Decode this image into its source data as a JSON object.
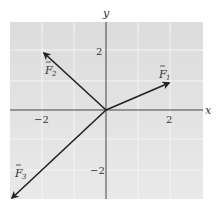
{
  "diagram": {
    "type": "vector-diagram",
    "axes": {
      "x_label": "x",
      "y_label": "y",
      "x_ticks": [
        {
          "value": -2,
          "label": "−2"
        },
        {
          "value": 2,
          "label": "2"
        }
      ],
      "y_ticks": [
        {
          "value": 2,
          "label": "2"
        },
        {
          "value": -2,
          "label": "−2"
        }
      ],
      "range": {
        "x": [
          -3,
          3
        ],
        "y": [
          -2.8,
          2.8
        ]
      },
      "grid": true
    },
    "vectors": [
      {
        "name": "F1",
        "label": "F",
        "subscript": "1",
        "from": [
          0,
          0
        ],
        "to": [
          2,
          0.85
        ]
      },
      {
        "name": "F2",
        "label": "F",
        "subscript": "2",
        "from": [
          0,
          0
        ],
        "to": [
          -2,
          1.8
        ]
      },
      {
        "name": "F3",
        "label": "F",
        "subscript": "3",
        "from": [
          0,
          0
        ],
        "to": [
          -3,
          -2.75
        ]
      }
    ],
    "colors": {
      "panel": "#dedede",
      "panel_light": "#e8e8e8",
      "grid_line": "#f2f2f2",
      "axis": "#444444",
      "vector": "#222222",
      "text": "#333333"
    }
  }
}
